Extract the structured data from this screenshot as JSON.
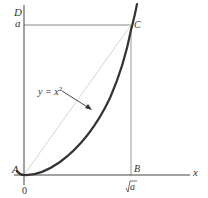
{
  "figure": {
    "points": {
      "A": "A",
      "B": "B",
      "C": "C",
      "D": "D"
    },
    "axis": {
      "x_label": "x",
      "y_tick": "a",
      "x_tick_origin": "0",
      "x_tick_sqrt": "√a",
      "x_tick_sqrt_radicand": "a"
    },
    "curve_label": {
      "base": "y = x",
      "exponent": "2"
    },
    "colors": {
      "axis": "#444444",
      "curve": "#333333",
      "guide": "#888888",
      "chord": "#cccccc"
    }
  }
}
